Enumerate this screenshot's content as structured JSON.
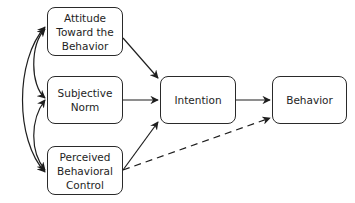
{
  "diagram": {
    "type": "path-model",
    "nodes": [
      {
        "id": "attitude",
        "label": "Attitude\nToward the\nBehavior"
      },
      {
        "id": "norm",
        "label": "Subjective\nNorm"
      },
      {
        "id": "pbc",
        "label": "Perceived\nBehavioral\nControl"
      },
      {
        "id": "intention",
        "label": "Intention"
      },
      {
        "id": "behavior",
        "label": "Behavior"
      }
    ],
    "edges": [
      {
        "from": "attitude",
        "to": "intention",
        "style": "solid"
      },
      {
        "from": "norm",
        "to": "intention",
        "style": "solid"
      },
      {
        "from": "pbc",
        "to": "intention",
        "style": "solid"
      },
      {
        "from": "intention",
        "to": "behavior",
        "style": "solid"
      },
      {
        "from": "pbc",
        "to": "behavior",
        "style": "dashed"
      },
      {
        "from": "attitude",
        "to": "norm",
        "style": "solid",
        "bidirectional": true,
        "curved": true
      },
      {
        "from": "norm",
        "to": "pbc",
        "style": "solid",
        "bidirectional": true,
        "curved": true
      },
      {
        "from": "attitude",
        "to": "pbc",
        "style": "solid",
        "bidirectional": true,
        "curved": true
      }
    ],
    "colors": {
      "stroke": "#2a2a2a",
      "background": "#ffffff"
    }
  }
}
